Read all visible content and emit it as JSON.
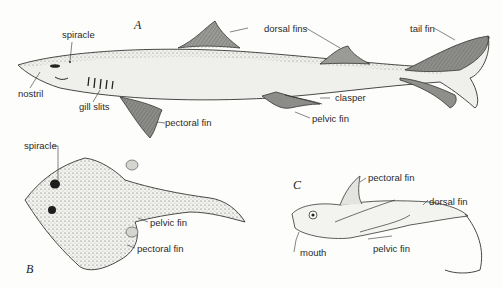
{
  "figures": {
    "a": {
      "letter": "A",
      "subject": "shark"
    },
    "b": {
      "letter": "B",
      "subject": "skate"
    },
    "c": {
      "letter": "C",
      "subject": "chimaera"
    }
  },
  "labels": {
    "a": {
      "spiracle": "spiracle",
      "nostril": "nostril",
      "gill_slits": "gill slits",
      "pectoral_fin": "pectoral fin",
      "dorsal_fins": "dorsal fins",
      "tail_fin": "tail fin",
      "clasper": "clasper",
      "pelvic_fin": "pelvic fin"
    },
    "b": {
      "spiracle": "spiracle",
      "pelvic_fin": "pelvic fin",
      "pectoral_fin": "pectoral fin"
    },
    "c": {
      "pectoral_fin": "pectoral fin",
      "dorsal_fin": "dorsal fin",
      "mouth": "mouth",
      "pelvic_fin": "pelvic fin"
    }
  },
  "colors": {
    "ink": "#2a2a2a",
    "fin_shade": "#8a8a86",
    "body": "#eeeeea"
  }
}
